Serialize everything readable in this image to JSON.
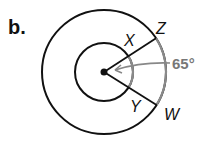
{
  "problem_label": "b.",
  "points": {
    "x": "X",
    "y": "Y",
    "z": "Z",
    "w": "W"
  },
  "angle_label": "65°",
  "colors": {
    "line": "#111111",
    "arc_highlight": "#8a8a8a"
  }
}
